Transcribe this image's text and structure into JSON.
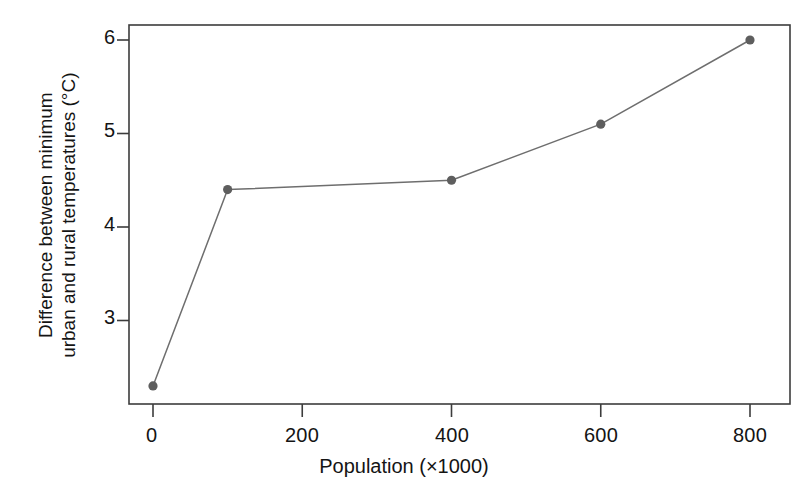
{
  "chart_data": {
    "type": "line",
    "title": "",
    "subtitle": "",
    "xlabel": "Population  (×1000)",
    "ylabel": "Difference between minimum urban and rural temperatures (°C)",
    "ylabel_line1": "Difference between minimum",
    "ylabel_line2": "urban and rural temperatures (°C)",
    "x": [
      0,
      100,
      400,
      600,
      800
    ],
    "values": [
      2.3,
      4.4,
      4.5,
      5.1,
      6.0
    ],
    "series": [
      {
        "name": "Urban heat island intensity",
        "x": [
          0,
          100,
          400,
          600,
          800
        ],
        "values": [
          2.3,
          4.4,
          4.5,
          5.1,
          6.0
        ]
      }
    ],
    "xticks": [
      0,
      200,
      400,
      600,
      800
    ],
    "xtick_labels": [
      "0",
      "200",
      "400",
      "600",
      "800"
    ],
    "yticks": [
      3,
      4,
      5,
      6
    ],
    "ytick_labels": [
      "3",
      "4",
      "5",
      "6"
    ],
    "xlim": [
      -40,
      815
    ],
    "ylim": [
      2.05,
      6.15
    ],
    "grid": false,
    "legend": false,
    "legend_position": "none",
    "marker": "filled-circle",
    "line_color": "#6e6e6e",
    "marker_color": "#5e5e5e",
    "axis_color": "#3c3c3c",
    "background": "#ffffff"
  },
  "axes": {
    "frame": {
      "left": 129,
      "right": 790,
      "top": 25,
      "bottom": 404
    }
  }
}
